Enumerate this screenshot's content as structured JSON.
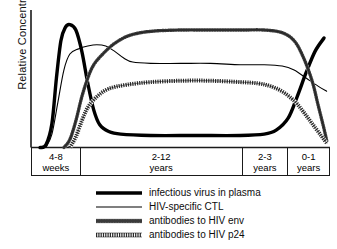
{
  "chart_data": {
    "type": "line",
    "title": "",
    "xlabel": "",
    "ylabel": "Relative Concentration",
    "grid": false,
    "legend_position": "bottom",
    "xlim": [
      0,
      100
    ],
    "ylim": [
      0,
      100
    ],
    "x_phases": [
      {
        "label_line1": "4-8",
        "label_line2": "weeks",
        "width_pct": 16.4
      },
      {
        "label_line1": "2-12",
        "label_line2": "years",
        "width_pct": 54.5
      },
      {
        "label_line1": "2-3",
        "label_line2": "years",
        "width_pct": 15.4
      },
      {
        "label_line1": "0-1",
        "label_line2": "years",
        "width_pct": 13.7
      }
    ],
    "series": [
      {
        "name": "infectious virus in plasma",
        "style": "thick-solid",
        "color": "#000000",
        "points": [
          [
            3,
            0
          ],
          [
            5,
            2
          ],
          [
            7,
            18
          ],
          [
            8.5,
            52
          ],
          [
            10,
            80
          ],
          [
            11.5,
            90
          ],
          [
            13,
            92
          ],
          [
            15,
            88
          ],
          [
            17,
            72
          ],
          [
            19,
            48
          ],
          [
            21,
            28
          ],
          [
            23,
            17
          ],
          [
            26,
            12
          ],
          [
            30,
            10
          ],
          [
            40,
            9
          ],
          [
            55,
            9
          ],
          [
            70,
            9
          ],
          [
            78,
            10
          ],
          [
            82,
            13
          ],
          [
            86,
            22
          ],
          [
            89,
            38
          ],
          [
            92,
            56
          ],
          [
            95,
            72
          ],
          [
            98,
            82
          ]
        ]
      },
      {
        "name": "HIV-specific CTL",
        "style": "thin-solid",
        "color": "#000000",
        "points": [
          [
            5,
            0
          ],
          [
            7,
            10
          ],
          [
            9,
            34
          ],
          [
            11,
            58
          ],
          [
            13,
            70
          ],
          [
            16,
            74
          ],
          [
            19,
            76
          ],
          [
            22,
            77
          ],
          [
            25,
            76
          ],
          [
            28,
            72
          ],
          [
            31,
            67
          ],
          [
            34,
            64
          ],
          [
            40,
            63
          ],
          [
            50,
            63
          ],
          [
            60,
            63
          ],
          [
            70,
            62
          ],
          [
            78,
            62
          ],
          [
            84,
            61
          ],
          [
            88,
            58
          ],
          [
            92,
            52
          ],
          [
            96,
            46
          ],
          [
            99,
            42
          ]
        ]
      },
      {
        "name": "antibodies to HIV env",
        "style": "dotted-bead",
        "color": "#000000",
        "points": [
          [
            11,
            0
          ],
          [
            13,
            6
          ],
          [
            15,
            20
          ],
          [
            17,
            38
          ],
          [
            19,
            52
          ],
          [
            21,
            62
          ],
          [
            24,
            70
          ],
          [
            28,
            78
          ],
          [
            33,
            84
          ],
          [
            40,
            87
          ],
          [
            50,
            88
          ],
          [
            60,
            88
          ],
          [
            70,
            88
          ],
          [
            78,
            88
          ],
          [
            84,
            86
          ],
          [
            88,
            80
          ],
          [
            91,
            68
          ],
          [
            94,
            50
          ],
          [
            96,
            32
          ],
          [
            98,
            14
          ],
          [
            99,
            4
          ]
        ]
      },
      {
        "name": "antibodies to HIV p24",
        "style": "hatched-zigzag",
        "color": "#000000",
        "points": [
          [
            13,
            0
          ],
          [
            15,
            8
          ],
          [
            17,
            20
          ],
          [
            19,
            30
          ],
          [
            22,
            38
          ],
          [
            26,
            44
          ],
          [
            32,
            47
          ],
          [
            40,
            49
          ],
          [
            50,
            50
          ],
          [
            60,
            50
          ],
          [
            70,
            49
          ],
          [
            76,
            48
          ],
          [
            80,
            46
          ],
          [
            84,
            42
          ],
          [
            88,
            35
          ],
          [
            91,
            27
          ],
          [
            94,
            18
          ],
          [
            97,
            9
          ],
          [
            99,
            3
          ]
        ]
      }
    ],
    "annotations": []
  },
  "legend": {
    "entries": [
      {
        "label": "infectious virus in plasma",
        "swatch": "thick-solid-line-icon"
      },
      {
        "label": "HIV-specific CTL",
        "swatch": "thin-solid-line-icon"
      },
      {
        "label": "antibodies to HIV env",
        "swatch": "beaded-dotted-line-icon"
      },
      {
        "label": "antibodies to HIV p24",
        "swatch": "zigzag-hatched-line-icon"
      }
    ]
  },
  "axis": {
    "y_label": "Relative Concentration"
  }
}
